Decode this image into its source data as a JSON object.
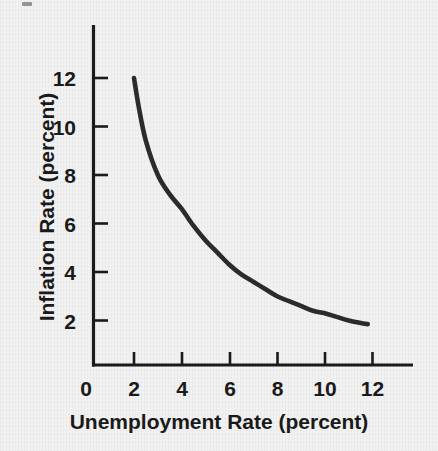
{
  "figure": {
    "background_color": "#f2f2f2",
    "ink_color": "#1a1a1a",
    "curve_color": "#2b2b2b"
  },
  "chart_data": {
    "type": "line",
    "title": "",
    "xlabel": "Unemployment Rate (percent)",
    "ylabel": "Inflation Rate (percent)",
    "xlim": [
      0,
      13.4
    ],
    "ylim": [
      0,
      13.0
    ],
    "grid": false,
    "legend": null,
    "series": [
      {
        "name": "Phillips curve",
        "x": [
          2.0,
          2.2,
          2.5,
          3.0,
          3.5,
          4.0,
          4.5,
          5.0,
          5.5,
          6.0,
          6.5,
          7.0,
          7.5,
          8.0,
          8.5,
          9.0,
          9.5,
          10.0,
          10.5,
          11.0,
          11.5,
          11.8
        ],
        "y": [
          12.0,
          10.8,
          9.4,
          8.0,
          7.2,
          6.6,
          5.9,
          5.3,
          4.8,
          4.3,
          3.9,
          3.6,
          3.3,
          3.0,
          2.8,
          2.6,
          2.4,
          2.3,
          2.15,
          2.0,
          1.9,
          1.85
        ]
      }
    ],
    "x_ticks": [
      0,
      2,
      4,
      6,
      8,
      10,
      12
    ],
    "x_tick_labels": [
      "0",
      "2",
      "4",
      "6",
      "8",
      "10",
      "12"
    ],
    "y_ticks": [
      2,
      4,
      6,
      8,
      10,
      12
    ],
    "y_tick_labels": [
      "2",
      "4",
      "6",
      "8",
      "10",
      "12"
    ]
  }
}
